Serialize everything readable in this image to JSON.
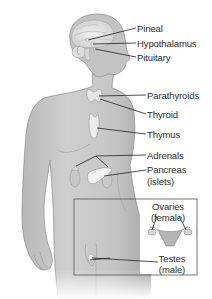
{
  "diagram": {
    "type": "anatomy-endocrine-system",
    "colors": {
      "background": "#ffffff",
      "body_fill": "#c9c9c9",
      "body_shadow": "#a9a9a9",
      "body_outline": "#7e7e7e",
      "gland_fill": "#e9e9e9",
      "leader_line": "#222222",
      "label_text": "#2b2b2b",
      "inset_border": "#555555"
    },
    "labels": {
      "pineal": "Pineal",
      "hypothalamus": "Hypothalamus",
      "pituitary": "Pituitary",
      "parathyroids": "Parathyroids",
      "thyroid": "Thyroid",
      "thymus": "Thymus",
      "adrenals": "Adrenals",
      "pancreas": "Pancreas",
      "pancreas_sub": "(islets)",
      "ovaries": "Ovaries",
      "ovaries_sub": "(female)",
      "testes": "Testes",
      "testes_sub": "(male)"
    }
  }
}
